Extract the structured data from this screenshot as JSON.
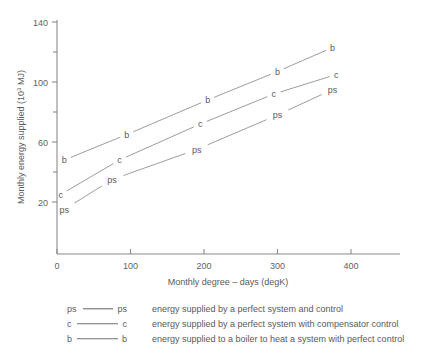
{
  "chart_data": {
    "type": "line",
    "title": "",
    "xlabel": "Monthly degree – days (degK)",
    "ylabel": "Monthly energy supplied (10³ MJ)",
    "ylabel_prefix": "Monthly energy supplied (10",
    "ylabel_exponent": "3",
    "ylabel_suffix": " MJ)",
    "xlim": [
      0,
      400
    ],
    "ylim": [
      0,
      140
    ],
    "xticks": [
      "0",
      "100",
      "200",
      "300",
      "400"
    ],
    "xtick_values": [
      0,
      100,
      200,
      300,
      400
    ],
    "yticks": [
      "20",
      "60",
      "100",
      "140"
    ],
    "ytick_values": [
      20,
      60,
      100,
      140
    ],
    "grid": false,
    "legend_position": "below-plot",
    "series": [
      {
        "name": "ps",
        "label": "ps",
        "legend_desc": "energy supplied by a perfect system and control",
        "x": [
          10,
          75,
          190,
          300,
          375
        ],
        "values": [
          15,
          35,
          55,
          78,
          95
        ]
      },
      {
        "name": "c",
        "label": "c",
        "legend_desc": "energy supplied by a perfect system with compensator control",
        "x": [
          5,
          85,
          195,
          295,
          380
        ],
        "values": [
          25,
          48,
          72,
          92,
          105
        ]
      },
      {
        "name": "b",
        "label": "b",
        "legend_desc": "energy supplied to a boiler to heat a system with perfect control",
        "x": [
          10,
          95,
          205,
          300,
          375
        ],
        "values": [
          48,
          65,
          88,
          107,
          123
        ]
      }
    ]
  },
  "legend": {
    "rows": [
      {
        "left": "ps",
        "right": "ps",
        "desc": "energy supplied by a perfect system and control"
      },
      {
        "left": "c",
        "right": "c",
        "desc": "energy supplied by a perfect system with compensator control"
      },
      {
        "left": "b",
        "right": "b",
        "desc": "energy supplied to a boiler to heat a system with perfect control"
      }
    ]
  },
  "colors": {
    "axis": "#8a8a8a",
    "series": "#8a8a8a",
    "text": "#5a5a5a",
    "background": "#ffffff"
  }
}
